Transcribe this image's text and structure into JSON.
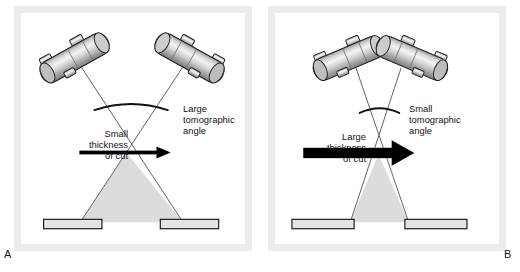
{
  "figure": {
    "type": "two-panel-diagram",
    "background_color": "#ffffff",
    "panel_frame_color": "#ececed"
  },
  "panels": [
    {
      "letter": "A",
      "letter_position": "bottom-left",
      "tomographic_angle": "large",
      "thickness_of_cut": "small",
      "labels": {
        "thickness": "Small\nthickness\nof cut",
        "angle": "Large\ntomographic\nangle"
      },
      "arrow": {
        "name": "thickness-of-cut-arrow",
        "thickness_px": 4,
        "direction": "right",
        "color": "#000000"
      },
      "tubes": [
        {
          "name": "x-ray-tube-left",
          "tilt_deg": -28
        },
        {
          "name": "x-ray-tube-right",
          "tilt_deg": 28
        }
      ],
      "beam_spread": "wide",
      "shaded_region_color": "#dcdcdc",
      "detector_plates": 2
    },
    {
      "letter": "B",
      "letter_position": "bottom-right",
      "tomographic_angle": "small",
      "thickness_of_cut": "large",
      "labels": {
        "thickness": "Large\nthickness\nof cut",
        "angle": "Small\ntomographic\nangle"
      },
      "arrow": {
        "name": "thickness-of-cut-arrow",
        "thickness_px": 11,
        "direction": "right",
        "color": "#000000"
      },
      "tubes": [
        {
          "name": "x-ray-tube-left",
          "tilt_deg": -22
        },
        {
          "name": "x-ray-tube-right",
          "tilt_deg": 22
        }
      ],
      "beam_spread": "narrow",
      "shaded_region_color": "#dcdcdc",
      "detector_plates": 2
    }
  ],
  "colors": {
    "tube_body_light": "#f2f2f2",
    "tube_body_mid": "#c9c9c9",
    "tube_body_dark": "#8c8c8c",
    "tube_outline": "#1f1f1f",
    "beam_line": "#4a4a4a",
    "shade_fill": "#dcdcdc",
    "shade_edge": "#6e6e6e",
    "plate_fill": "#e4e4e4",
    "plate_outline": "#111111",
    "text": "#141414"
  }
}
